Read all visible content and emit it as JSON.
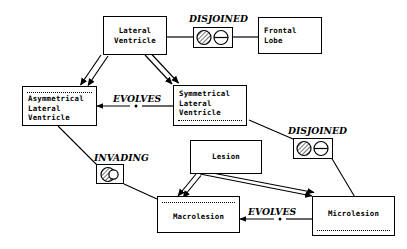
{
  "diagram": {
    "background_color": "#ffffff",
    "line_color": "#000000",
    "nodes": [
      {
        "id": "lateral_ventricle",
        "label": "Lateral\nVentricle",
        "partition": "none"
      },
      {
        "id": "frontal_lobe",
        "label": "Frontal\nLobe",
        "partition": "none"
      },
      {
        "id": "asymmetrical_lv",
        "label": "Asymmetrical\nLateral\nVentricle",
        "partition": "top"
      },
      {
        "id": "symmetrical_lv",
        "label": "Symmetrical\nLateral\nVentricle",
        "partition": "bottom"
      },
      {
        "id": "lesion",
        "label": "Lesion",
        "partition": "none"
      },
      {
        "id": "macrolesion",
        "label": "Macrolesion",
        "partition": "top"
      },
      {
        "id": "microlesion",
        "label": "Microlesion",
        "partition": "bottom"
      }
    ],
    "relations": [
      {
        "id": "disjoined_top",
        "label": "DISJOINED",
        "icon": "disjoined-circles-icon",
        "from": "lateral_ventricle",
        "to": "frontal_lobe"
      },
      {
        "id": "disjoined_right",
        "label": "DISJOINED",
        "icon": "disjoined-circles-icon",
        "from": "symmetrical_lv",
        "to": "microlesion"
      },
      {
        "id": "invading",
        "label": "INVADING",
        "icon": "invading-circles-icon",
        "from": "asymmetrical_lv",
        "to": "macrolesion"
      },
      {
        "id": "evolves_top",
        "label": "EVOLVES",
        "icon": "dot-marker-icon",
        "from": "symmetrical_lv",
        "to": "asymmetrical_lv"
      },
      {
        "id": "evolves_bottom",
        "label": "EVOLVES",
        "icon": "dot-marker-icon",
        "from": "microlesion",
        "to": "macrolesion"
      }
    ],
    "generalizations": [
      {
        "id": "isa_lv_asym",
        "from": "lateral_ventricle",
        "to": "asymmetrical_lv"
      },
      {
        "id": "isa_lv_sym",
        "from": "lateral_ventricle",
        "to": "symmetrical_lv"
      },
      {
        "id": "isa_les_macro",
        "from": "lesion",
        "to": "macrolesion"
      },
      {
        "id": "isa_les_micro",
        "from": "lesion",
        "to": "microlesion"
      }
    ]
  }
}
